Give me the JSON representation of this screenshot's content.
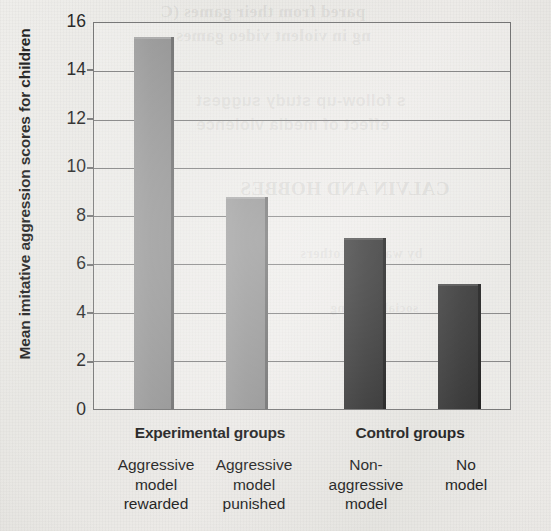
{
  "chart_data": {
    "type": "bar",
    "title": "",
    "xlabel": "",
    "ylabel": "Mean imitative aggression scores for children",
    "ylim": [
      0,
      16
    ],
    "ytick_labels": [
      "16",
      "14",
      "12",
      "10",
      "8",
      "6",
      "4",
      "2",
      "0"
    ],
    "yticks": [
      16,
      14,
      12,
      10,
      8,
      6,
      4,
      2,
      0
    ],
    "grid": true,
    "legend": "none",
    "categories": [
      "Aggressive model rewarded",
      "Aggressive model punished",
      "Non-aggressive model",
      "No model"
    ],
    "category_lines": [
      [
        "Aggressive",
        "model",
        "rewarded"
      ],
      [
        "Aggressive",
        "model",
        "punished"
      ],
      [
        "Non-",
        "aggressive",
        "model"
      ],
      [
        "No",
        "model"
      ]
    ],
    "values": [
      15.4,
      8.8,
      7.1,
      5.2
    ],
    "bar_colors": [
      "#939393",
      "#939393",
      "#2a2a2a",
      "#2a2a2a"
    ],
    "groups": [
      {
        "label": "Experimental groups",
        "categories": [
          0,
          1
        ]
      },
      {
        "label": "Control groups",
        "categories": [
          2,
          3
        ]
      }
    ]
  },
  "axis": {
    "y_label": "Mean imitative aggression scores for children",
    "tick_16": "16",
    "tick_14": "14",
    "tick_12": "12",
    "tick_10": "10",
    "tick_8": "8",
    "tick_6": "6",
    "tick_4": "4",
    "tick_2": "2",
    "tick_0": "0"
  },
  "groups": {
    "experimental": "Experimental groups",
    "control": "Control groups"
  },
  "categories": {
    "bar1": {
      "l1": "Aggressive",
      "l2": "model",
      "l3": "rewarded"
    },
    "bar2": {
      "l1": "Aggressive",
      "l2": "model",
      "l3": "punished"
    },
    "bar3": {
      "l1": "Non-",
      "l2": "aggressive",
      "l3": "model"
    },
    "bar4": {
      "l1": "No",
      "l2": "model",
      "l3": ""
    }
  },
  "ghost_text": {
    "g1": "pared from their games (C",
    "g2": "ng in violent video games",
    "g3": "s follow-up study suggest",
    "g4": "effect of media violence",
    "g5": "CALVIN AND HOBBES",
    "g6": "by watching others",
    "g7": "social learning"
  },
  "colors": {
    "light_bar": "#939393",
    "dark_bar": "#2a2a2a",
    "axis": "#6f6f6f",
    "gridline": "#7c7c7c",
    "paper": "#e9e8e5",
    "text": "#1b1b1b"
  }
}
